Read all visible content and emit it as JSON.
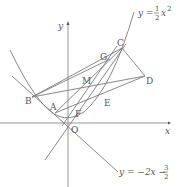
{
  "diagram": {
    "type": "coordinate-geometry",
    "axes": {
      "x_label": "x",
      "y_label": "y",
      "origin_label": "O"
    },
    "curves": {
      "parabola": {
        "eq_lhs": "y =",
        "eq_num": "1",
        "eq_den": "2",
        "eq_var": "x",
        "eq_exp": "2"
      },
      "line": {
        "eq_lhs": "y = −2x −",
        "eq_num": "3",
        "eq_den": "2"
      }
    },
    "points": [
      {
        "name": "A",
        "x": 55,
        "y": 113,
        "lx": 50,
        "ly": 110
      },
      {
        "name": "B",
        "x": 32,
        "y": 97,
        "lx": 25,
        "ly": 104
      },
      {
        "name": "C",
        "x": 122,
        "y": 48,
        "lx": 117,
        "ly": 46
      },
      {
        "name": "D",
        "x": 145,
        "y": 76,
        "lx": 146,
        "ly": 84
      },
      {
        "name": "E",
        "x": 103,
        "y": 98,
        "lx": 104,
        "ly": 106
      },
      {
        "name": "F",
        "x": 75,
        "y": 110,
        "lx": 75,
        "ly": 117
      },
      {
        "name": "G",
        "x": 110,
        "y": 59,
        "lx": 100,
        "ly": 60
      },
      {
        "name": "M",
        "x": 89,
        "y": 83,
        "lx": 82,
        "ly": 84
      },
      {
        "name": "O",
        "x": 68,
        "y": 123,
        "lx": 71,
        "ly": 133
      }
    ],
    "colors": {
      "line": "#7a7a7a",
      "text": "#555555",
      "background": "#ffffff"
    }
  }
}
